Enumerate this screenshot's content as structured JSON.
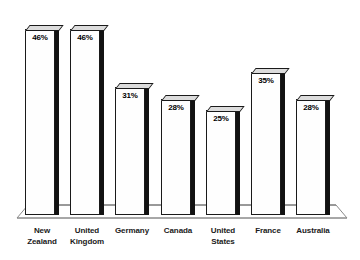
{
  "chart_data": {
    "type": "bar",
    "title": "",
    "subtitle": "",
    "xlabel": "",
    "ylabel": "",
    "ylim": [
      0,
      50
    ],
    "grid": false,
    "legend": "none",
    "style": "3d-bar-grayscale",
    "categories": [
      "New Zealand",
      "United Kingdom",
      "Germany",
      "Canada",
      "United States",
      "France",
      "Australia"
    ],
    "values": [
      46,
      46,
      31,
      28,
      25,
      35,
      28
    ],
    "value_labels": [
      "46%",
      "46%",
      "31%",
      "28%",
      "25%",
      "35%",
      "28%"
    ],
    "categories_wrapped": [
      [
        "New",
        "Zealand"
      ],
      [
        "United",
        "Kingdom"
      ],
      [
        "Germany",
        ""
      ],
      [
        "Canada",
        ""
      ],
      [
        "United",
        "States"
      ],
      [
        "France",
        ""
      ],
      [
        "Australia",
        ""
      ]
    ]
  },
  "colors": {
    "background": "#ffffff",
    "bar_front": "#fefefe",
    "bar_outline": "#1a1a1a",
    "bar_side": "#121212",
    "bar_top": "#dcdcdc",
    "label_text": "#1a1a1a",
    "value_text": "#000000",
    "floor_line": "#8a8a8a"
  }
}
